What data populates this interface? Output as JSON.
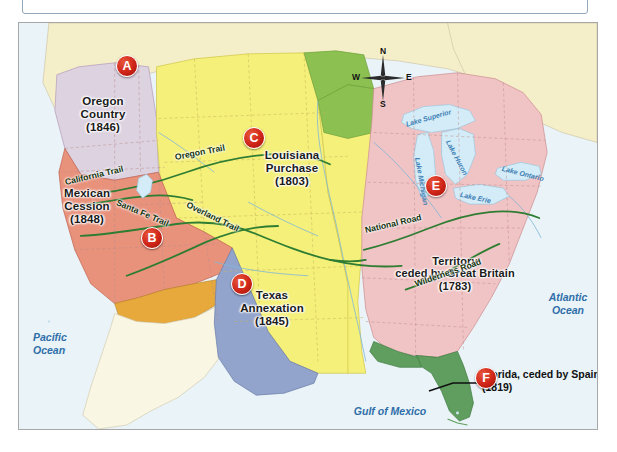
{
  "page": {
    "top_panel_present": true
  },
  "map": {
    "frame_border_color": "#a7a7a7",
    "ocean_color": "#e9f3f8",
    "territories": [
      {
        "key": "oregon",
        "marker": "A",
        "label": "Oregon\nCountry\n(1846)",
        "color": "#ddd2e0",
        "name": "Oregon Country",
        "year": "1846"
      },
      {
        "key": "mexican",
        "marker": "B",
        "label": "Mexican\nCession\n(1848)",
        "color": "#e8927c",
        "name": "Mexican Cession",
        "year": "1848"
      },
      {
        "key": "louisiana",
        "marker": "C",
        "label": "Louisiana\nPurchase\n(1803)",
        "color": "#f5f07a",
        "name": "Louisiana Purchase",
        "year": "1803"
      },
      {
        "key": "texas",
        "marker": "D",
        "label": "Texas\nAnnexation\n(1845)",
        "color": "#92a4cc",
        "name": "Texas Annexation",
        "year": "1845"
      },
      {
        "key": "british",
        "marker": "E",
        "label": "Territory\nceded by Great Britain\n(1783)",
        "color": "#f0c3c4",
        "name": "Territory ceded by Great Britain",
        "year": "1783"
      },
      {
        "key": "florida",
        "marker": "F",
        "label": "Florida, ceded by\nSpain (1819)",
        "color": "#5f9e5e",
        "name": "Florida ceded by Spain",
        "year": "1819"
      }
    ],
    "other_regions": [
      {
        "key": "red-river",
        "color": "#8cc152",
        "name": "Red River Cession"
      },
      {
        "key": "mexico",
        "color": "#e8a93c",
        "name": "Mexico"
      },
      {
        "key": "canada",
        "color": "#f5efc9",
        "name": "Canada"
      }
    ],
    "trails": [
      {
        "name": "Oregon Trail"
      },
      {
        "name": "California Trail"
      },
      {
        "name": "Santa Fe Trail"
      },
      {
        "name": "Overland Trail"
      },
      {
        "name": "National Road"
      },
      {
        "name": "Wilderness Road"
      }
    ],
    "waters": [
      {
        "name": "Pacific\nOcean"
      },
      {
        "name": "Atlantic\nOcean"
      },
      {
        "name": "Gulf of Mexico"
      }
    ],
    "lakes": [
      {
        "name": "Lake Superior"
      },
      {
        "name": "Lake Michigan"
      },
      {
        "name": "Lake Huron"
      },
      {
        "name": "Lake Erie"
      },
      {
        "name": "Lake Ontario"
      }
    ],
    "compass": {
      "north": "N",
      "south": "S",
      "east": "E",
      "west": "W"
    },
    "callout": {
      "florida": "Florida, ceded by\nSpain (1819)"
    },
    "markers": [
      "A",
      "B",
      "C",
      "D",
      "E",
      "F"
    ]
  }
}
